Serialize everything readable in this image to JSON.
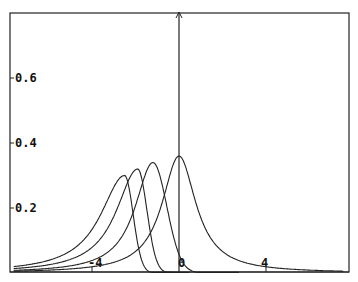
{
  "chart_data": {
    "type": "line",
    "title": "",
    "xlabel": "",
    "ylabel": "",
    "xlim": [
      -7.8,
      7.8
    ],
    "ylim": [
      0,
      0.8
    ],
    "grid": false,
    "legend": null,
    "x_ticks": [
      "-4",
      "0",
      "4"
    ],
    "y_ticks": [
      "0.2",
      "0.4",
      "0.6"
    ],
    "series": [
      {
        "name": "curve-1",
        "peak_x": -2.5,
        "peak_y": 0.3,
        "shape": "skewed, long left tail, sharp right cutoff"
      },
      {
        "name": "curve-2",
        "peak_x": -1.9,
        "peak_y": 0.32,
        "shape": "skewed, long left tail, sharp right cutoff"
      },
      {
        "name": "curve-3",
        "peak_x": -1.2,
        "peak_y": 0.34,
        "shape": "skewed, long left tail, moderate right decay"
      },
      {
        "name": "curve-4",
        "peak_x": 0.0,
        "peak_y": 0.36,
        "shape": "Cauchy-like, symmetric heavy tails"
      }
    ]
  },
  "axes": {
    "x_tick_labels": [
      "-4",
      "0",
      "4"
    ],
    "y_tick_labels": [
      "0.2",
      "0.4",
      "0.6"
    ]
  }
}
